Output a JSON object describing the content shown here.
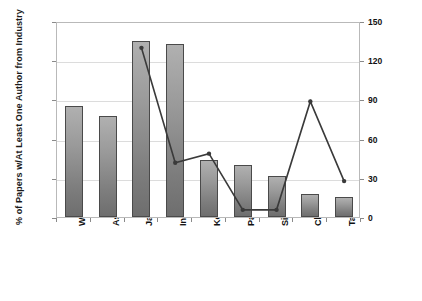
{
  "chart_data": {
    "type": "bar",
    "title": "",
    "categories": [
      "World",
      "Asia",
      "Japan",
      "India",
      "Korea, South",
      "Pakistan",
      "Singapore",
      "China",
      "Taiwan"
    ],
    "xlabel": "",
    "grid": true,
    "legend": "none",
    "series": [
      {
        "name": "% of Papers w/At Least One Author from Industry",
        "type": "bar",
        "axis": "left",
        "values": [
          34,
          31,
          54,
          53,
          17.5,
          16,
          12.5,
          7,
          6
        ]
      },
      {
        "name": "Volume of RE Publications per Country",
        "type": "line",
        "axis": "right",
        "values": [
          null,
          null,
          131,
          43,
          50,
          7,
          7,
          90,
          29
        ]
      }
    ],
    "left_axis": {
      "label": "% of Papers w/At Least One Author from Industry",
      "ticks": [
        "0%",
        "12%",
        "24%",
        "36%",
        "48%",
        "60%"
      ],
      "values": [
        0,
        12,
        24,
        36,
        48,
        60
      ],
      "min": 0,
      "max": 60
    },
    "right_axis": {
      "label": "Volume of RE Publications per Country",
      "ticks": [
        "0",
        "30",
        "60",
        "90",
        "120",
        "150"
      ],
      "values": [
        0,
        30,
        60,
        90,
        120,
        150
      ],
      "min": 0,
      "max": 150
    },
    "colors": {
      "bar_fill_top": "#b0b0b0",
      "bar_fill_bottom": "#6e6e6e",
      "bar_border": "#4a4a4a",
      "line": "#3a3a3a",
      "grid": "#dcdcdc",
      "frame": "#b9b9b9",
      "text": "#111111"
    }
  }
}
